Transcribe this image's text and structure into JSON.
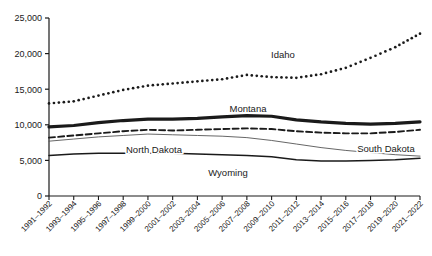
{
  "chart_data": {
    "type": "line",
    "title": "",
    "subtitle": "",
    "xlabel": "",
    "ylabel": "",
    "ylim": [
      0,
      25000
    ],
    "ytick_values": [
      0,
      5000,
      10000,
      15000,
      20000,
      25000
    ],
    "ytick_labels": [
      "0",
      "5,000",
      "10,000",
      "15,000",
      "20,000",
      "25,000"
    ],
    "grid": false,
    "legend_position": "inline-annotations",
    "categories": [
      "1991–1992",
      "1993–1994",
      "1995–1996",
      "1997–1998",
      "1999–2000",
      "2001–2002",
      "2003–2004",
      "2005–2006",
      "2007–2008",
      "2009–2010",
      "2011–2012",
      "2013–2014",
      "2015–2016",
      "2017–2018",
      "2019–2020",
      "2021–2022"
    ],
    "series": [
      {
        "name": "Idaho",
        "style": "dotted",
        "color": "#1a1a1a",
        "values": [
          13000,
          13300,
          14100,
          14900,
          15500,
          15800,
          16100,
          16400,
          17000,
          16700,
          16600,
          17100,
          18000,
          19400,
          20900,
          22800
        ]
      },
      {
        "name": "Montana",
        "style": "thick-solid",
        "color": "#1a1a1a",
        "values": [
          9700,
          9900,
          10300,
          10600,
          10800,
          10800,
          10900,
          11100,
          11300,
          11200,
          10700,
          10400,
          10200,
          10100,
          10200,
          10400
        ]
      },
      {
        "name": "South Dakota",
        "style": "dashed",
        "color": "#1a1a1a",
        "values": [
          8200,
          8500,
          8800,
          9100,
          9300,
          9200,
          9300,
          9400,
          9500,
          9400,
          9100,
          8900,
          8800,
          8800,
          9000,
          9300
        ]
      },
      {
        "name": "North Dakota",
        "style": "thin-solid",
        "color": "#555555",
        "values": [
          7700,
          8000,
          8300,
          8500,
          8700,
          8600,
          8500,
          8400,
          8200,
          7800,
          7300,
          6800,
          6400,
          6100,
          5800,
          5600
        ]
      },
      {
        "name": "Wyoming",
        "style": "thin-solid-dark",
        "color": "#1a1a1a",
        "values": [
          5700,
          5900,
          6000,
          6000,
          6000,
          6000,
          5900,
          5800,
          5700,
          5500,
          5100,
          4900,
          4900,
          5000,
          5100,
          5300
        ]
      }
    ],
    "annotations": [
      {
        "text": "Idaho",
        "x_px": 283,
        "y_px": 58
      },
      {
        "text": "Montana",
        "x_px": 248,
        "y_px": 112
      },
      {
        "text": "North Dakota",
        "x_px": 154,
        "y_px": 153
      },
      {
        "text": "South Dakota",
        "x_px": 386,
        "y_px": 152
      },
      {
        "text": "Wyoming",
        "x_px": 228,
        "y_px": 176
      }
    ]
  }
}
